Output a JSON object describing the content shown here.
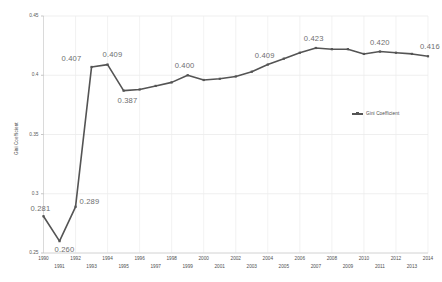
{
  "chart_data": {
    "type": "line",
    "title": "",
    "subtitle": "",
    "xlabel": "",
    "ylabel": "Gini Coefficient",
    "ylim": [
      0.25,
      0.45
    ],
    "yticks": [
      "0.25",
      "0.3",
      "0.35",
      "0.4",
      "0.45"
    ],
    "ytick_values": [
      0.25,
      0.3,
      0.35,
      0.4,
      0.45
    ],
    "grid": "vertical-and-horizontal-light",
    "legend_position": "right-middle",
    "legend": [
      "Gini Coefficient"
    ],
    "series_color": "#545454",
    "x": [
      1990,
      1991,
      1992,
      1993,
      1994,
      1995,
      1996,
      1997,
      1998,
      1999,
      2000,
      2001,
      2002,
      2003,
      2004,
      2005,
      2006,
      2007,
      2008,
      2009,
      2010,
      2011,
      2012,
      2013,
      2014
    ],
    "xtick_labels": [
      "1990",
      "1991",
      "1992",
      "1993",
      "1994",
      "1995",
      "1996",
      "1997",
      "1998",
      "1999",
      "2000",
      "2001",
      "2002",
      "2003",
      "2004",
      "2005",
      "2006",
      "2007",
      "2008",
      "2009",
      "2010",
      "2011",
      "2012",
      "2013",
      "2014"
    ],
    "series": [
      {
        "name": "Gini Coefficient",
        "values": [
          0.281,
          0.26,
          0.289,
          0.407,
          0.409,
          0.387,
          0.388,
          0.391,
          0.394,
          0.4,
          0.396,
          0.397,
          0.399,
          0.403,
          0.409,
          0.414,
          0.419,
          0.423,
          0.422,
          0.422,
          0.418,
          0.42,
          0.419,
          0.418,
          0.416
        ]
      }
    ],
    "point_labels": [
      {
        "x": 1990,
        "value": 0.281,
        "text": "0.281"
      },
      {
        "x": 1991,
        "value": 0.26,
        "text": "0.260"
      },
      {
        "x": 1992,
        "value": 0.289,
        "text": "0.289"
      },
      {
        "x": 1993,
        "value": 0.407,
        "text": "0.407"
      },
      {
        "x": 1994,
        "value": 0.409,
        "text": "0.409"
      },
      {
        "x": 1995,
        "value": 0.387,
        "text": "0.387"
      },
      {
        "x": 1999,
        "value": 0.4,
        "text": "0.400"
      },
      {
        "x": 2004,
        "value": 0.409,
        "text": "0.409"
      },
      {
        "x": 2007,
        "value": 0.423,
        "text": "0.423"
      },
      {
        "x": 2011,
        "value": 0.42,
        "text": "0.420"
      },
      {
        "x": 2014,
        "value": 0.416,
        "text": "0.416"
      }
    ]
  }
}
